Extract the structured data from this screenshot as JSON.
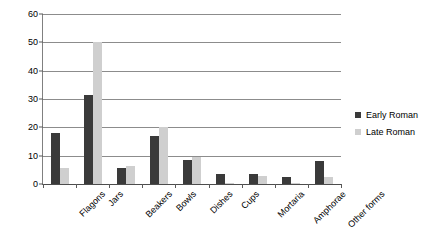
{
  "chart_data": {
    "type": "bar",
    "title": "",
    "subtitle": "",
    "xlabel": "",
    "ylabel": "",
    "ylim": [
      0,
      60
    ],
    "yticks": [
      0,
      10,
      20,
      30,
      40,
      50,
      60
    ],
    "ytick_labels": [
      "0",
      "10",
      "20",
      "30",
      "40",
      "50",
      "60"
    ],
    "grid": true,
    "grid_axis": "y",
    "legend_position": "right",
    "categories": [
      "Flagons",
      "Jars",
      "Beakers",
      "Bowls",
      "Dishes",
      "Cups",
      "Mortaria",
      "Amphorae",
      "Other forms"
    ],
    "series": [
      {
        "name": "Early Roman",
        "color": "#3a3a3a",
        "values": [
          18,
          31.5,
          5.5,
          17,
          8.5,
          3.7,
          3.5,
          2.5,
          8
        ]
      },
      {
        "name": "Late Roman",
        "color": "#cfcfcf",
        "values": [
          5.5,
          50,
          6.2,
          20,
          9.7,
          0.2,
          3,
          0.2,
          2.5
        ]
      }
    ]
  },
  "legend": {
    "items": [
      {
        "label": "Early Roman",
        "swatch": "early"
      },
      {
        "label": "Late Roman",
        "swatch": "late"
      }
    ]
  },
  "colors": {
    "early_roman": "#3a3a3a",
    "late_roman": "#cfcfcf",
    "gridline": "#8c8c8c",
    "axis": "#4d4d4d",
    "background": "#ffffff"
  }
}
